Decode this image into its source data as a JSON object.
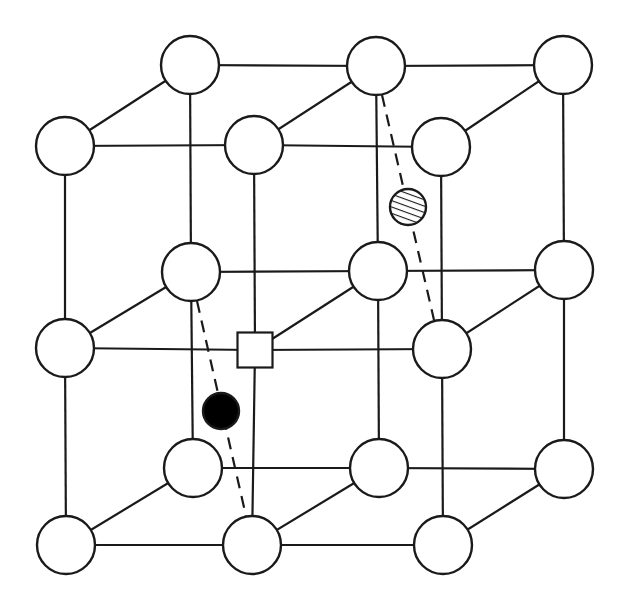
{
  "diagram": {
    "title": "",
    "type": "crystal-lattice",
    "colors": {
      "stroke": "#1a1a1a",
      "fill": "#ffffff",
      "solid": "#000000"
    },
    "atom_radius": 29,
    "interstitial_radius": 18,
    "atoms": [
      {
        "id": "b-t-l",
        "x": 190,
        "y": 65
      },
      {
        "id": "b-t-m",
        "x": 376,
        "y": 66
      },
      {
        "id": "b-t-r",
        "x": 563,
        "y": 65
      },
      {
        "id": "b-m-l",
        "x": 191,
        "y": 272
      },
      {
        "id": "b-m-m",
        "x": 378,
        "y": 271
      },
      {
        "id": "b-m-r",
        "x": 564,
        "y": 270
      },
      {
        "id": "b-b-l",
        "x": 193,
        "y": 468
      },
      {
        "id": "b-b-m",
        "x": 379,
        "y": 468
      },
      {
        "id": "b-b-r",
        "x": 564,
        "y": 469
      },
      {
        "id": "f-t-l",
        "x": 65,
        "y": 146
      },
      {
        "id": "f-t-m",
        "x": 254,
        "y": 145
      },
      {
        "id": "f-t-r",
        "x": 441,
        "y": 147
      },
      {
        "id": "f-m-l",
        "x": 65,
        "y": 348
      },
      {
        "id": "f-m-r",
        "x": 442,
        "y": 349
      },
      {
        "id": "f-b-l",
        "x": 66,
        "y": 545
      },
      {
        "id": "f-b-m",
        "x": 252,
        "y": 545
      },
      {
        "id": "f-b-r",
        "x": 443,
        "y": 545
      }
    ],
    "vacancy": {
      "label": "vacancy (square)",
      "x": 255,
      "y": 350,
      "size": 35
    },
    "interstitials": [
      {
        "label": "substitutional/interstitial (hatched)",
        "x": 408,
        "y": 207,
        "style": "hatched"
      },
      {
        "label": "interstitial (solid)",
        "x": 221,
        "y": 411,
        "style": "solid"
      }
    ]
  }
}
